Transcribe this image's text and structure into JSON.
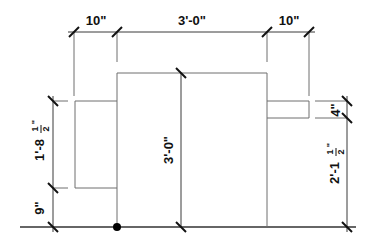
{
  "diagram": {
    "type": "architectural-elevation-dimensions",
    "top_dimensions": [
      {
        "label": "10\"",
        "from_x": 74,
        "to_x": 117
      },
      {
        "label": "3'-0\"",
        "from_x": 117,
        "to_x": 267
      },
      {
        "label": "10\"",
        "from_x": 267,
        "to_x": 309
      }
    ],
    "left_dimensions": [
      {
        "label": "1'-8",
        "fraction": "1/2",
        "suffix": "\""
      },
      {
        "label": "9\""
      }
    ],
    "center_dimension": {
      "label": "3'-0\""
    },
    "right_dimensions": [
      {
        "label": "4\""
      },
      {
        "label": "2'-1",
        "fraction": "1/2",
        "suffix": "\""
      }
    ],
    "labels": {
      "top_left": "10\"",
      "top_center": "3'-0\"",
      "top_right": "10\"",
      "left_upper_main": "1'-8",
      "left_upper_num": "1",
      "left_upper_den": "2",
      "left_upper_inch": "\"",
      "left_lower": "9\"",
      "center": "3'-0\"",
      "right_upper": "4\"",
      "right_lower_main": "2'-1",
      "right_lower_num": "1",
      "right_lower_den": "2",
      "right_lower_inch": "\""
    },
    "colors": {
      "lines": "#6e6e6e",
      "ticks": "#111111",
      "text": "#111111",
      "background": "#ffffff"
    }
  }
}
